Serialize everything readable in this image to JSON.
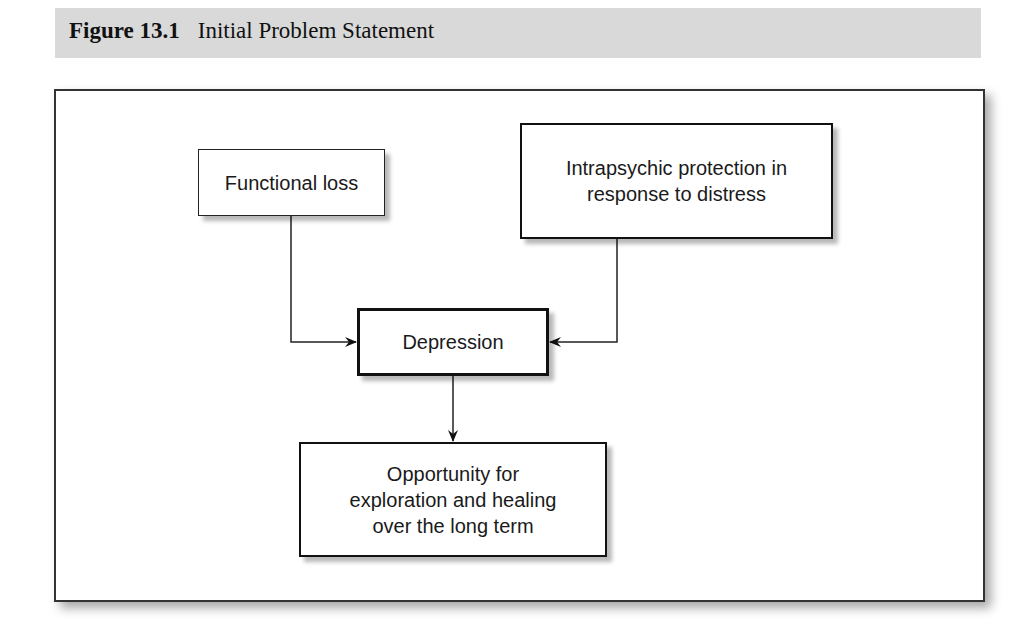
{
  "caption": {
    "figure_number": "Figure 13.1",
    "title": "Initial Problem Statement"
  },
  "diagram": {
    "nodes": [
      {
        "id": "functional_loss",
        "label": "Functional loss"
      },
      {
        "id": "intrapsychic",
        "label": "Intrapsychic protection in response to distress",
        "lines": [
          "Intrapsychic protection in",
          "response to distress"
        ]
      },
      {
        "id": "depression",
        "label": "Depression"
      },
      {
        "id": "opportunity",
        "label": "Opportunity for exploration and healing over the long term",
        "lines": [
          "Opportunity for",
          "exploration and healing",
          "over the long term"
        ]
      }
    ],
    "edges": [
      {
        "from": "functional_loss",
        "to": "depression"
      },
      {
        "from": "intrapsychic",
        "to": "depression"
      },
      {
        "from": "depression",
        "to": "opportunity"
      }
    ]
  }
}
